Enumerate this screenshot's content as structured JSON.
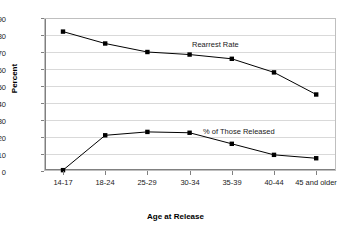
{
  "chart_data": {
    "type": "line",
    "title": "",
    "xlabel": "Age at Release",
    "ylabel": "Percent",
    "ylim": [
      0,
      90
    ],
    "ytick_step": 10,
    "grid": true,
    "legend_position": "inline-annotation",
    "categories": [
      "14-17",
      "18-24",
      "25-29",
      "30-34",
      "35-39",
      "40-44",
      "45 and older"
    ],
    "series": [
      {
        "name": "Rearrest Rate",
        "values": [
          82,
          75,
          70,
          68.5,
          66,
          58,
          45
        ],
        "color": "#000000",
        "marker": "square"
      },
      {
        "name": "% of Those Released",
        "values": [
          0.5,
          21,
          23,
          22.5,
          16,
          9.5,
          7.5
        ],
        "color": "#000000",
        "marker": "square"
      }
    ]
  },
  "axes": {
    "y_title": "Percent",
    "y_ticks": [
      "90",
      "80",
      "70",
      "60",
      "50",
      "40",
      "30",
      "20",
      "10",
      "0"
    ],
    "x_title": "Age at Release",
    "x_ticks": [
      "14-17",
      "18-24",
      "25-29",
      "30-34",
      "35-39",
      "40-44",
      "45 and older"
    ]
  },
  "annotations": {
    "series_1_label": "Rearrest Rate",
    "series_2_label": "% of Those Released"
  },
  "colors": {
    "line": "#000000",
    "grid": "#d9d9d9",
    "axis": "#808080",
    "background": "#ffffff",
    "text": "#1a1a1a"
  }
}
